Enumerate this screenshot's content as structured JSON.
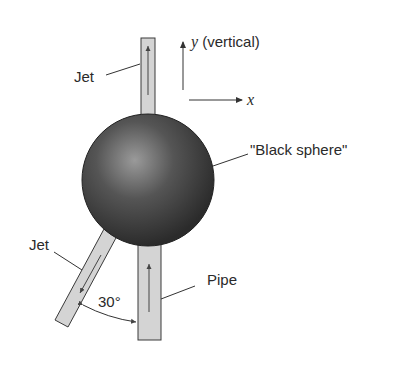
{
  "diagram": {
    "labels": {
      "jet_top": "Jet",
      "jet_angled": "Jet",
      "pipe": "Pipe",
      "sphere": "\"Black sphere\"",
      "y_axis_var": "y",
      "y_axis_note": " (vertical)",
      "x_axis_var": "x",
      "angle": "30°"
    },
    "angle_deg": 30,
    "colors": {
      "pipe_fill": "#d4d4d4",
      "pipe_stroke": "#3a3a3a",
      "sphere_dark": "#2e2e2e",
      "sphere_highlight": "#9a9a9a",
      "line": "#333333"
    }
  }
}
